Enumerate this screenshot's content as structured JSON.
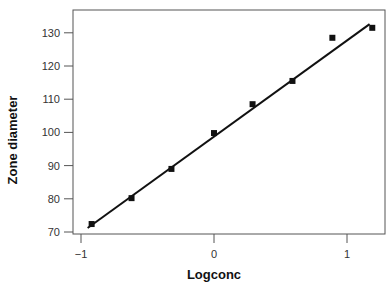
{
  "chart_data": {
    "type": "scatter",
    "title": "",
    "xlabel": "Logconc",
    "ylabel": "Zone diameter",
    "xlim": [
      -1.07,
      1.28
    ],
    "ylim": [
      69.3,
      137
    ],
    "xticks": [
      -1,
      0,
      1
    ],
    "xtick_labels": [
      "−1",
      "0",
      "1"
    ],
    "yticks": [
      70,
      80,
      90,
      100,
      110,
      120,
      130
    ],
    "ytick_labels": [
      "70",
      "80",
      "90",
      "100",
      "110",
      "120",
      "130"
    ],
    "grid": false,
    "legend": null,
    "series": [
      {
        "name": "observed",
        "kind": "scatter",
        "marker": "square",
        "x": [
          -0.92,
          -0.62,
          -0.32,
          0.0,
          0.29,
          0.59,
          0.89,
          1.19
        ],
        "y": [
          72.4,
          80.2,
          89.0,
          99.8,
          108.5,
          115.5,
          128.5,
          131.5
        ]
      },
      {
        "name": "fitted line",
        "kind": "line",
        "x": [
          -0.95,
          1.17
        ],
        "y": [
          71.2,
          132.6
        ]
      }
    ]
  },
  "colors": {
    "axis": "#555555",
    "marker": "#111111",
    "line": "#111111"
  }
}
